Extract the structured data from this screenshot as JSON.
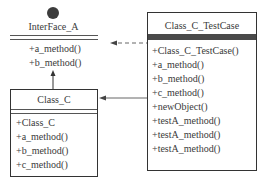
{
  "interface": {
    "name": "InterFace_A",
    "methods": [
      "+a_method()",
      "+b_method()"
    ]
  },
  "class_c": {
    "name": "Class_C",
    "members": [
      "+Class_C",
      "+a_method()",
      "+b_method()",
      "+c_method()"
    ]
  },
  "testcase": {
    "name": "Class_C_TestCase",
    "methods": [
      "+Class_C_TestCase()",
      "+a_method()",
      "+b_method()",
      "+c_method()",
      "+newObject()",
      "+testA_method()",
      "+testA_method()",
      "+testA_method()"
    ]
  },
  "relations": [
    {
      "from": "Class_C",
      "to": "InterFace_A",
      "type": "realization"
    },
    {
      "from": "Class_C_TestCase",
      "to": "InterFace_A",
      "type": "dependency-dashed"
    },
    {
      "from": "Class_C_TestCase",
      "to": "Class_C",
      "type": "association"
    }
  ]
}
